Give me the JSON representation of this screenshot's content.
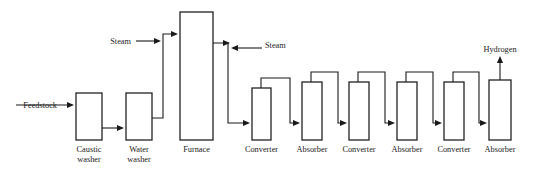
{
  "diagram": {
    "stroke_color": "#1a1a1a",
    "background_color": "#ffffff",
    "vessels": [
      {
        "id": "caustic-washer",
        "label_line1": "Caustic",
        "label_line2": "washer",
        "x": 76,
        "y": 93,
        "w": 26,
        "h": 47
      },
      {
        "id": "water-washer",
        "label_line1": "Water",
        "label_line2": "washer",
        "x": 126,
        "y": 93,
        "w": 26,
        "h": 47
      },
      {
        "id": "furnace",
        "label_line1": "Furnace",
        "label_line2": "",
        "x": 180,
        "y": 12,
        "w": 33,
        "h": 128
      },
      {
        "id": "converter-1",
        "label_line1": "Converter",
        "label_line2": "",
        "x": 252,
        "y": 88,
        "w": 19,
        "h": 52
      },
      {
        "id": "absorber-1",
        "label_line1": "Absorber",
        "label_line2": "",
        "x": 302,
        "y": 82,
        "w": 20,
        "h": 58
      },
      {
        "id": "converter-2",
        "label_line1": "Converter",
        "label_line2": "",
        "x": 349,
        "y": 82,
        "w": 20,
        "h": 58
      },
      {
        "id": "absorber-2",
        "label_line1": "Absorber",
        "label_line2": "",
        "x": 397,
        "y": 82,
        "w": 20,
        "h": 58
      },
      {
        "id": "converter-3",
        "label_line1": "Converter",
        "label_line2": "",
        "x": 444,
        "y": 82,
        "w": 20,
        "h": 58
      },
      {
        "id": "absorber-3",
        "label_line1": "Absorber",
        "label_line2": "",
        "x": 489,
        "y": 80,
        "w": 22,
        "h": 60
      }
    ],
    "stream_labels": [
      {
        "id": "feedstock",
        "text": "Feedstock",
        "x": 57,
        "y": 108,
        "anchor": "end"
      },
      {
        "id": "steam-1",
        "text": "Steam",
        "x": 131,
        "y": 44,
        "anchor": "end"
      },
      {
        "id": "steam-2",
        "text": "Steam",
        "x": 265,
        "y": 48,
        "anchor": "start"
      },
      {
        "id": "hydrogen",
        "text": "Hydrogen",
        "x": 500,
        "y": 52,
        "anchor": "middle"
      }
    ],
    "pipes": [
      {
        "id": "feedstock-inlet",
        "d": "M 16 105 L 72 105"
      },
      {
        "id": "caustic-to-water",
        "d": "M 102 128 L 122 128"
      },
      {
        "id": "water-to-furnace",
        "d": "M 152 118 L 163 118 L 163 34 L 176 34"
      },
      {
        "id": "steam1-inlet",
        "d": "M 136 41 L 159 41"
      },
      {
        "id": "furnace-to-converter1",
        "d": "M 213 43 L 228 43 L 228 123 L 248 123"
      },
      {
        "id": "steam2-inlet",
        "d": "M 262 48 L 233 48"
      },
      {
        "id": "converter1-to-absorber1",
        "d": "M 261 88 L 261 78 L 290 78 L 290 123 L 298 123"
      },
      {
        "id": "absorber1-to-converter2",
        "d": "M 311 82 L 311 72 L 338 72 L 338 123 L 345 123"
      },
      {
        "id": "converter2-to-absorber2",
        "d": "M 358 82 L 358 72 L 385 72 L 385 123 L 393 123"
      },
      {
        "id": "absorber2-to-converter3",
        "d": "M 406 82 L 406 72 L 433 72 L 433 123 L 440 123"
      },
      {
        "id": "converter3-to-absorber3",
        "d": "M 453 82 L 453 72 L 479 72 L 479 123 L 485 123"
      },
      {
        "id": "hydrogen-outlet",
        "d": "M 500 80 L 500 58"
      }
    ],
    "arrowheads": [
      {
        "id": "feedstock-arrow",
        "x": 74,
        "y": 105,
        "dir": "right"
      },
      {
        "id": "caustic-out-arrow",
        "x": 124,
        "y": 128,
        "dir": "right"
      },
      {
        "id": "steam1-arrow",
        "x": 161,
        "y": 41,
        "dir": "right"
      },
      {
        "id": "furnace-in-arrow",
        "x": 178,
        "y": 34,
        "dir": "right"
      },
      {
        "id": "furnace-out-arrow",
        "x": 230,
        "y": 43,
        "dir": "right"
      },
      {
        "id": "steam2-arrow",
        "x": 231,
        "y": 48,
        "dir": "left"
      },
      {
        "id": "converter1-in-arrow",
        "x": 250,
        "y": 123,
        "dir": "right"
      },
      {
        "id": "absorber1-in-arrow",
        "x": 300,
        "y": 123,
        "dir": "right"
      },
      {
        "id": "converter2-in-arrow",
        "x": 347,
        "y": 123,
        "dir": "right"
      },
      {
        "id": "absorber2-in-arrow",
        "x": 395,
        "y": 123,
        "dir": "right"
      },
      {
        "id": "converter3-in-arrow",
        "x": 442,
        "y": 123,
        "dir": "right"
      },
      {
        "id": "absorber3-in-arrow",
        "x": 487,
        "y": 123,
        "dir": "right"
      },
      {
        "id": "hydrogen-arrow",
        "x": 500,
        "y": 56,
        "dir": "up"
      }
    ]
  }
}
